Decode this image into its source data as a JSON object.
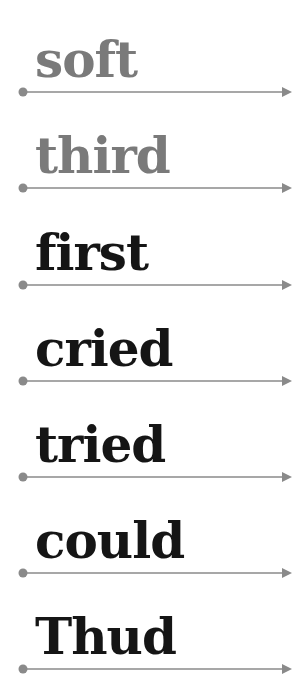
{
  "colors": {
    "faded_text": "#7a7a7a",
    "dark_text": "#151515",
    "line": "#8a8a8a"
  },
  "rows": [
    {
      "word": "soft",
      "style": "faded"
    },
    {
      "word": "third",
      "style": "faded"
    },
    {
      "word": "first",
      "style": "dark"
    },
    {
      "word": "cried",
      "style": "dark"
    },
    {
      "word": "tried",
      "style": "dark"
    },
    {
      "word": "could",
      "style": "dark"
    },
    {
      "word": "Thud",
      "style": "dark"
    }
  ],
  "icons": {
    "line_start": "dot-icon",
    "line_end": "arrow-right-icon"
  }
}
